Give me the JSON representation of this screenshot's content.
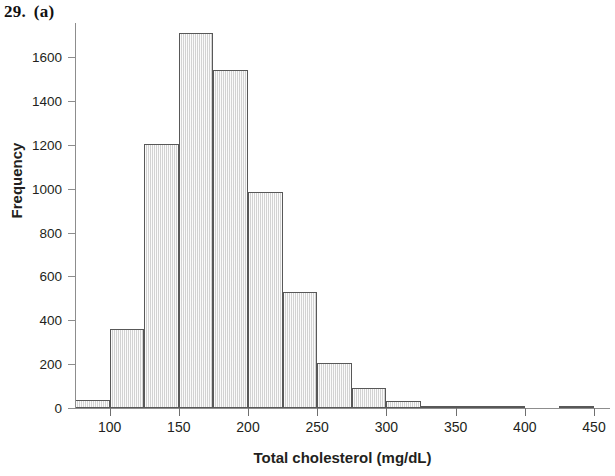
{
  "figure": {
    "number": "29.",
    "part": "(a)"
  },
  "chart_data": {
    "type": "bar",
    "chart_subtype": "histogram",
    "title": "",
    "xlabel": "Total cholesterol (mg/dL)",
    "ylabel": "Frequency",
    "xlim": [
      75,
      450
    ],
    "ylim": [
      0,
      1750
    ],
    "grid": false,
    "legend": null,
    "bin_width": 25,
    "x_ticks": [
      100,
      150,
      200,
      250,
      300,
      350,
      400,
      450
    ],
    "x_tick_labels": [
      "100",
      "150",
      "200",
      "250",
      "300",
      "350",
      "400",
      "450"
    ],
    "y_ticks": [
      0,
      200,
      400,
      600,
      800,
      1000,
      1200,
      1400,
      1600
    ],
    "y_tick_labels": [
      "0",
      "200",
      "400",
      "600",
      "800",
      "1000",
      "1200",
      "1400",
      "1600"
    ],
    "bins": [
      {
        "start": 75,
        "end": 100,
        "label": "75-100",
        "value": 35
      },
      {
        "start": 100,
        "end": 125,
        "label": "100-125",
        "value": 360
      },
      {
        "start": 125,
        "end": 150,
        "label": "125-150",
        "value": 1205
      },
      {
        "start": 150,
        "end": 175,
        "label": "150-175",
        "value": 1710
      },
      {
        "start": 175,
        "end": 200,
        "label": "175-200",
        "value": 1540
      },
      {
        "start": 200,
        "end": 225,
        "label": "200-225",
        "value": 985
      },
      {
        "start": 225,
        "end": 250,
        "label": "225-250",
        "value": 530
      },
      {
        "start": 250,
        "end": 275,
        "label": "250-275",
        "value": 205
      },
      {
        "start": 275,
        "end": 300,
        "label": "275-300",
        "value": 90
      },
      {
        "start": 300,
        "end": 325,
        "label": "300-325",
        "value": 30
      },
      {
        "start": 325,
        "end": 350,
        "label": "325-350",
        "value": 8
      },
      {
        "start": 350,
        "end": 375,
        "label": "350-375",
        "value": 4
      },
      {
        "start": 375,
        "end": 400,
        "label": "375-400",
        "value": 3
      },
      {
        "start": 400,
        "end": 425,
        "label": "400-425",
        "value": 0
      },
      {
        "start": 425,
        "end": 450,
        "label": "425-450",
        "value": 3
      }
    ],
    "categories": [
      "75-100",
      "100-125",
      "125-150",
      "150-175",
      "175-200",
      "200-225",
      "225-250",
      "250-275",
      "275-300",
      "300-325",
      "325-350",
      "350-375",
      "375-400",
      "400-425",
      "425-450"
    ],
    "values": [
      35,
      360,
      1205,
      1710,
      1540,
      985,
      530,
      205,
      90,
      30,
      8,
      4,
      3,
      0,
      3
    ]
  },
  "style": {
    "bar_fill": "#e3e3e3",
    "bar_border": "#585858",
    "axis_color": "#8d8d8d",
    "text_color": "#231f20",
    "background": "#ffffff"
  }
}
